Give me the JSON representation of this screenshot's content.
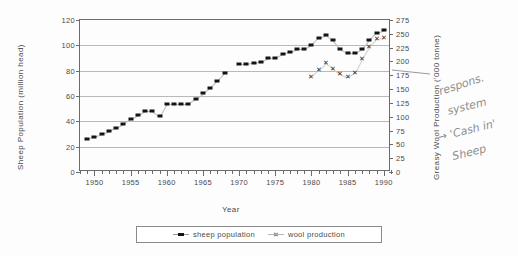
{
  "chart_data": {
    "type": "line",
    "title": "",
    "xlabel": "Year",
    "ylabel_left": "Sheep Population (million head)",
    "ylabel_right": "Greasy Wool Production ('000 tonne)",
    "xlim": [
      1948,
      1991
    ],
    "ylim_left": [
      0,
      120
    ],
    "ylim_right": [
      0,
      275
    ],
    "yticks_left": [
      "0",
      "20",
      "40",
      "60",
      "80",
      "100",
      "120"
    ],
    "yticks_right": [
      "0",
      "25",
      "50",
      "75",
      "100",
      "125",
      "150",
      "175",
      "200",
      "225",
      "250",
      "275"
    ],
    "xticks": [
      "1950",
      "1955",
      "1960",
      "1965",
      "1970",
      "1975",
      "1980",
      "1985",
      "1990"
    ],
    "grid": true,
    "legend_position": "bottom",
    "series": [
      {
        "name": "sheep population",
        "axis": "left",
        "marker": "filled-square",
        "x": [
          1949,
          1950,
          1951,
          1952,
          1953,
          1954,
          1955,
          1956,
          1957,
          1958,
          1959,
          1960,
          1961,
          1962,
          1963,
          1964,
          1965,
          1966,
          1967,
          1968,
          1970,
          1971,
          1972,
          1973,
          1974,
          1975,
          1976,
          1977,
          1978,
          1979,
          1980,
          1981,
          1982,
          1983,
          1984,
          1985,
          1986,
          1987,
          1988,
          1989,
          1990
        ],
        "values": [
          26,
          28,
          30,
          32,
          35,
          38,
          42,
          45,
          48,
          48,
          44,
          54,
          54,
          54,
          54,
          58,
          62,
          66,
          72,
          78,
          85,
          85,
          86,
          87,
          90,
          90,
          93,
          95,
          97,
          97,
          100,
          106,
          108,
          104,
          97,
          94,
          94,
          97,
          104,
          110,
          112
        ]
      },
      {
        "name": "wool production",
        "axis": "right",
        "marker": "x",
        "x": [
          1980,
          1981,
          1982,
          1983,
          1984,
          1985,
          1986,
          1987,
          1988,
          1989,
          1990
        ],
        "values": [
          172,
          185,
          197,
          187,
          178,
          172,
          180,
          205,
          226,
          240,
          242
        ]
      }
    ]
  },
  "legend": {
    "items": [
      {
        "label": "sheep population"
      },
      {
        "label": "wool production"
      }
    ]
  },
  "annotations": {
    "handwritten": [
      {
        "text": "respons.",
        "x": 438,
        "y": 78,
        "rotate": -18
      },
      {
        "text": "system",
        "x": 447,
        "y": 100,
        "rotate": -14
      },
      {
        "text": "→ 'Cash in'",
        "x": 437,
        "y": 124,
        "rotate": -14
      },
      {
        "text": "Sheep",
        "x": 452,
        "y": 146,
        "rotate": -14
      }
    ]
  }
}
